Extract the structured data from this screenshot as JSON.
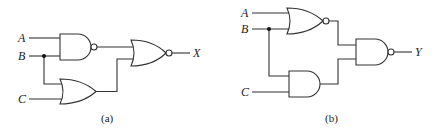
{
  "circuits": [
    {
      "id": "a",
      "caption": "(a)",
      "inputs": [
        "A",
        "B",
        "C"
      ],
      "output": "X",
      "gates": [
        {
          "type": "NAND",
          "inputs": [
            "A",
            "B"
          ]
        },
        {
          "type": "OR",
          "inputs": [
            "B",
            "C"
          ]
        },
        {
          "type": "NOR",
          "inputs": [
            "NAND_out",
            "OR_out"
          ],
          "output": "X"
        }
      ]
    },
    {
      "id": "b",
      "caption": "(b)",
      "inputs": [
        "A",
        "B",
        "C"
      ],
      "output": "Y",
      "gates": [
        {
          "type": "NOR",
          "inputs": [
            "A",
            "B"
          ]
        },
        {
          "type": "AND",
          "inputs": [
            "B",
            "C"
          ]
        },
        {
          "type": "NAND",
          "inputs": [
            "NOR_out",
            "AND_out"
          ],
          "output": "Y"
        }
      ]
    }
  ],
  "colors": {
    "line": "#333333",
    "background": "#ffffff"
  }
}
